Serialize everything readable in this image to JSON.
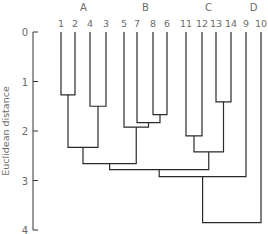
{
  "chart_data": {
    "type": "dendrogram",
    "title": "",
    "xlabel": "",
    "ylabel": "Euclidean distance",
    "ylim": [
      0,
      4
    ],
    "y_ticks": [
      "0",
      "1",
      "2",
      "3",
      "4"
    ],
    "y_inverted": true,
    "grid": false,
    "leaf_order": [
      "1",
      "2",
      "4",
      "3",
      "5",
      "7",
      "8",
      "6",
      "11",
      "12",
      "13",
      "14",
      "9",
      "10"
    ],
    "cluster_labels": [
      {
        "label": "A",
        "leaves": [
          "1",
          "2",
          "4",
          "3"
        ]
      },
      {
        "label": "B",
        "leaves": [
          "5",
          "7",
          "8",
          "6"
        ]
      },
      {
        "label": "C",
        "leaves": [
          "11",
          "12",
          "13",
          "14"
        ]
      },
      {
        "label": "D",
        "leaves": [
          "9",
          "10"
        ]
      }
    ],
    "merges": [
      {
        "id": "m1",
        "left": "1",
        "right": "2",
        "height": 1.27
      },
      {
        "id": "m2",
        "left": "13",
        "right": "14",
        "height": 1.41
      },
      {
        "id": "m3",
        "left": "4",
        "right": "3",
        "height": 1.5
      },
      {
        "id": "m4",
        "left": "8",
        "right": "6",
        "height": 1.67
      },
      {
        "id": "m5",
        "left": "7",
        "right": "m4",
        "height": 1.83
      },
      {
        "id": "m6",
        "left": "5",
        "right": "m5",
        "height": 1.92
      },
      {
        "id": "m7",
        "left": "11",
        "right": "12",
        "height": 2.1
      },
      {
        "id": "m8",
        "left": "m1",
        "right": "m3",
        "height": 2.33
      },
      {
        "id": "m9",
        "left": "m7",
        "right": "m2",
        "height": 2.42
      },
      {
        "id": "m10",
        "left": "m8",
        "right": "m6",
        "height": 2.66
      },
      {
        "id": "m11",
        "left": "m10",
        "right": "m9",
        "height": 2.78
      },
      {
        "id": "m12",
        "left": "m11",
        "right": "9",
        "height": 2.92
      },
      {
        "id": "m13",
        "left": "m12",
        "right": "10",
        "height": 3.85
      }
    ]
  }
}
